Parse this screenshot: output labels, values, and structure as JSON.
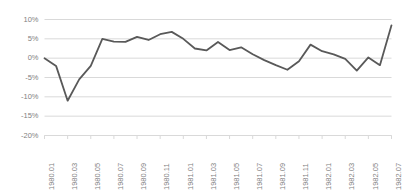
{
  "chart_data": {
    "type": "line",
    "title": "",
    "xlabel": "",
    "ylabel": "",
    "grid": true,
    "legend": false,
    "ylim": [
      -0.2,
      0.1
    ],
    "ytick_labels": [
      "10%",
      "5%",
      "0%",
      "-5%",
      "-10%",
      "-15%",
      "-20%"
    ],
    "ytick_values": [
      0.1,
      0.05,
      0.0,
      -0.05,
      -0.1,
      -0.15,
      -0.2
    ],
    "x": [
      "1980.01",
      "1980.02",
      "1980.03",
      "1980.04",
      "1980.05",
      "1980.06",
      "1980.07",
      "1980.08",
      "1980.09",
      "1980.10",
      "1980.11",
      "1980.12",
      "1981.01",
      "1981.02",
      "1981.03",
      "1981.04",
      "1981.05",
      "1981.06",
      "1981.07",
      "1981.08",
      "1981.09",
      "1981.10",
      "1981.11",
      "1981.12",
      "1982.01",
      "1982.02",
      "1982.03",
      "1982.04",
      "1982.05",
      "1982.06",
      "1982.07"
    ],
    "xtick_labels": [
      "1980.01",
      "1980.03",
      "1980.05",
      "1980.07",
      "1980.09",
      "1980.11",
      "1981.01",
      "1981.03",
      "1981.05",
      "1981.07",
      "1981.09",
      "1981.11",
      "1982.01",
      "1982.03",
      "1982.05",
      "1982.07"
    ],
    "xtick_indices": [
      0,
      2,
      4,
      6,
      8,
      10,
      12,
      14,
      16,
      18,
      20,
      22,
      24,
      26,
      28,
      30
    ],
    "values": [
      0.0,
      -0.02,
      -0.11,
      -0.055,
      -0.02,
      0.05,
      0.043,
      0.042,
      0.055,
      0.047,
      0.062,
      0.068,
      0.05,
      0.025,
      0.02,
      0.042,
      0.021,
      0.028,
      0.01,
      -0.005,
      -0.018,
      -0.03,
      -0.008,
      0.035,
      0.018,
      0.01,
      -0.002,
      -0.032,
      0.002,
      -0.018,
      0.085
    ],
    "series_name": "",
    "line_color": "#595959",
    "grid_color": "#d9d9d9",
    "axis_color": "#d9d9d9",
    "tick_text_color": "#7f7f7f",
    "background_color": "#ffffff"
  }
}
